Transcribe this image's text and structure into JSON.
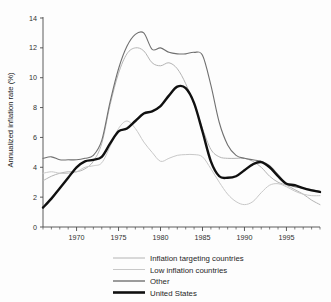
{
  "chart_data": {
    "type": "line",
    "title": "",
    "xlabel": "",
    "ylabel": "Annualized inflation rate (%)",
    "xlim": [
      1966,
      1999
    ],
    "ylim": [
      0,
      14
    ],
    "grid": false,
    "legend_position": "bottom",
    "y_ticks": [
      "0",
      "2",
      "4",
      "6",
      "8",
      "10",
      "12",
      "14"
    ],
    "y_tick_values": [
      0,
      2,
      4,
      6,
      8,
      10,
      12,
      14
    ],
    "x_ticks": [
      "1970",
      "1975",
      "1980",
      "1985",
      "1990",
      "1995"
    ],
    "x_tick_values": [
      1970,
      1975,
      1980,
      1985,
      1990,
      1995
    ],
    "x_minor_step": 1,
    "series": [
      {
        "name": "Inflation targeting countries",
        "color": "#b4b4b4",
        "width": 1.0,
        "x": [
          1966,
          1967,
          1968,
          1969,
          1970,
          1971,
          1972,
          1973,
          1974,
          1975,
          1976,
          1977,
          1978,
          1979,
          1980,
          1981,
          1982,
          1983,
          1984,
          1985,
          1986,
          1987,
          1988,
          1989,
          1990,
          1991,
          1992,
          1993,
          1994,
          1995,
          1996,
          1997,
          1998,
          1999
        ],
        "values": [
          3.1,
          3.4,
          3.6,
          3.7,
          3.7,
          3.9,
          4.4,
          5.6,
          8.2,
          10.3,
          11.6,
          12.0,
          11.8,
          11.0,
          10.8,
          11.0,
          10.6,
          9.6,
          8.2,
          6.6,
          5.2,
          4.7,
          4.6,
          4.6,
          4.6,
          4.4,
          4.0,
          3.4,
          3.0,
          2.8,
          2.5,
          2.2,
          1.8,
          1.5
        ]
      },
      {
        "name": "Low inflation countries",
        "color": "#c8c8c8",
        "width": 1.0,
        "x": [
          1966,
          1967,
          1968,
          1969,
          1970,
          1971,
          1972,
          1973,
          1974,
          1975,
          1976,
          1977,
          1978,
          1979,
          1980,
          1981,
          1982,
          1983,
          1984,
          1985,
          1986,
          1987,
          1988,
          1989,
          1990,
          1991,
          1992,
          1993,
          1994,
          1995,
          1996,
          1997,
          1998,
          1999
        ],
        "values": [
          3.6,
          3.7,
          3.6,
          3.6,
          3.7,
          4.0,
          4.1,
          4.3,
          5.4,
          6.6,
          7.1,
          6.6,
          5.7,
          5.0,
          4.4,
          4.6,
          4.8,
          4.85,
          4.85,
          4.7,
          3.9,
          3.0,
          2.2,
          1.7,
          1.5,
          1.7,
          2.3,
          2.8,
          2.9,
          2.7,
          2.4,
          2.2,
          2.1,
          2.1
        ]
      },
      {
        "name": "Other",
        "color": "#707070",
        "width": 1.1,
        "x": [
          1966,
          1967,
          1968,
          1969,
          1970,
          1971,
          1972,
          1973,
          1974,
          1975,
          1976,
          1977,
          1978,
          1979,
          1980,
          1981,
          1982,
          1983,
          1984,
          1985,
          1986,
          1987,
          1988,
          1989,
          1990,
          1991,
          1992,
          1993,
          1994,
          1995,
          1996,
          1997,
          1998,
          1999
        ],
        "values": [
          4.6,
          4.7,
          4.5,
          4.5,
          4.5,
          4.6,
          4.8,
          5.8,
          8.4,
          10.6,
          12.1,
          12.9,
          13.0,
          11.9,
          12.0,
          11.7,
          11.6,
          11.6,
          11.7,
          11.5,
          9.5,
          7.0,
          5.5,
          4.8,
          4.6,
          4.5,
          4.4,
          4.1,
          3.5,
          2.9,
          2.7,
          2.6,
          2.5,
          2.4
        ]
      },
      {
        "name": "United States",
        "color": "#101010",
        "width": 2.4,
        "x": [
          1966,
          1967,
          1968,
          1969,
          1970,
          1971,
          1972,
          1973,
          1974,
          1975,
          1976,
          1977,
          1978,
          1979,
          1980,
          1981,
          1982,
          1983,
          1984,
          1985,
          1986,
          1987,
          1988,
          1989,
          1990,
          1991,
          1992,
          1993,
          1994,
          1995,
          1996,
          1997,
          1998,
          1999
        ],
        "values": [
          1.3,
          1.9,
          2.6,
          3.3,
          4.0,
          4.4,
          4.5,
          4.7,
          5.6,
          6.4,
          6.6,
          7.1,
          7.6,
          7.75,
          8.1,
          8.8,
          9.4,
          9.3,
          8.3,
          6.4,
          4.4,
          3.4,
          3.3,
          3.4,
          3.8,
          4.2,
          4.35,
          4.0,
          3.4,
          2.9,
          2.8,
          2.6,
          2.45,
          2.35
        ]
      }
    ],
    "legend": [
      {
        "label": "Inflation targeting countries",
        "color": "#b4b4b4",
        "width": 1.0
      },
      {
        "label": "Low inflation countries",
        "color": "#c8c8c8",
        "width": 1.0
      },
      {
        "label": "Other",
        "color": "#707070",
        "width": 1.4
      },
      {
        "label": "United States",
        "color": "#101010",
        "width": 2.6
      }
    ]
  }
}
